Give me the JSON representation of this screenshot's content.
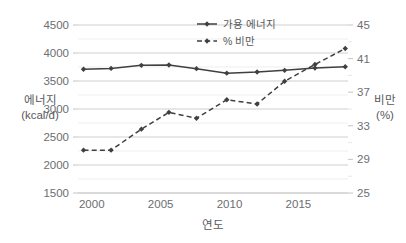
{
  "chart_data": {
    "type": "line",
    "title": "",
    "xlabel": "연도",
    "ylabel": "에너지\n(kcal/d)",
    "y2label": "비만\n(%)",
    "xlim": [
      1999,
      2018.6
    ],
    "ylim": [
      1500,
      4500
    ],
    "y2lim": [
      25,
      45
    ],
    "grid": true,
    "legend_position": "top-center",
    "x_ticks": [
      "2000",
      "2005",
      "2010",
      "2015"
    ],
    "x_tick_values": [
      2000,
      2005,
      2010,
      2015
    ],
    "y_ticks": [
      "1500",
      "2000",
      "2500",
      "3000",
      "3500",
      "4000",
      "4500"
    ],
    "y_tick_values": [
      1500,
      2000,
      2500,
      3000,
      3500,
      4000,
      4500
    ],
    "y_minor_step": 250,
    "y2_ticks": [
      "25",
      "29",
      "33",
      "37",
      "41",
      "45"
    ],
    "y2_tick_values": [
      25,
      29,
      33,
      37,
      41,
      45
    ],
    "y2_minor_step": 2,
    "series": [
      {
        "name": "가용 에너지",
        "axis": "left",
        "style": "solid",
        "color": "#404040",
        "marker": "diamond",
        "x": [
          1999.4,
          2001.4,
          2003.6,
          2005.6,
          2007.6,
          2009.8,
          2012.0,
          2014.0,
          2016.2,
          2018.4
        ],
        "values": [
          3710,
          3725,
          3780,
          3785,
          3720,
          3640,
          3660,
          3690,
          3730,
          3755
        ]
      },
      {
        "name": "% 비만",
        "axis": "right",
        "style": "dashed",
        "color": "#404040",
        "marker": "diamond",
        "x": [
          1999.4,
          2001.4,
          2003.6,
          2005.6,
          2007.6,
          2009.8,
          2012.0,
          2014.0,
          2016.2,
          2018.4
        ],
        "values": [
          30.1,
          30.1,
          32.6,
          34.6,
          33.9,
          36.1,
          35.6,
          38.3,
          40.3,
          42.2
        ]
      }
    ]
  },
  "axes": {
    "left_title_line1": "에너지",
    "left_title_line2": "(kcal/d)",
    "right_title_line1": "비만",
    "right_title_line2": "(%)",
    "bottom_title": "연도"
  },
  "legend": {
    "items": [
      {
        "label": "가용 에너지",
        "style": "solid"
      },
      {
        "label": "% 비만",
        "style": "dashed"
      }
    ]
  }
}
